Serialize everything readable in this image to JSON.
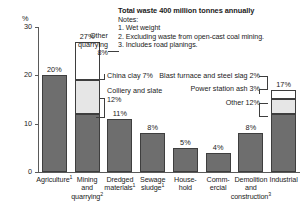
{
  "header": {
    "title": "Total waste 400 million tonnes annually",
    "notes_label": "Notes:",
    "notes": [
      "1. Wet weight",
      "2. Excluding waste from open-cast coal mining.",
      "3. Includes road planings."
    ]
  },
  "axis": {
    "y_unit": "%",
    "y_ticks": [
      "30",
      "20",
      "10",
      "0"
    ]
  },
  "callouts": {
    "other_quarrying": {
      "line1": "Other",
      "line2": "quarrying",
      "line3": "8%"
    },
    "china_clay": "China clay 7%",
    "colliery_1": "Colliery and slate",
    "colliery_2": "12%",
    "blast_furnace": "Blast furnace and steel slag 2%",
    "power_station": "Power station ash 3%",
    "other_industrial": "Other 12%"
  },
  "chart_data": {
    "type": "bar",
    "title": "Total waste 400 million tonnes annually",
    "xlabel": "",
    "ylabel": "%",
    "ylim": [
      0,
      30
    ],
    "yticks": [
      0,
      10,
      20,
      30
    ],
    "grid": false,
    "legend": "none",
    "stacked": true,
    "categories": [
      "Agriculture¹",
      "Mining and quarrying ²",
      "Dredged materials¹",
      "Sewage sludge ¹",
      "House-hold",
      "Comm-ercial",
      "Demolition and construction³",
      "Industrial"
    ],
    "totals": [
      20,
      27,
      11,
      8,
      5,
      4,
      8,
      17
    ],
    "total_labels": [
      "20%",
      "27%",
      "11%",
      "8%",
      "5%",
      "4%",
      "8%",
      "17%"
    ],
    "bars": [
      {
        "category": "Agriculture¹",
        "total": 20,
        "segments": [
          {
            "label": "Agriculture",
            "value": 20,
            "fill": "dark"
          }
        ]
      },
      {
        "category": "Mining and quarrying ²",
        "total": 27,
        "segments": [
          {
            "label": "Colliery and slate",
            "value": 12,
            "fill": "dark"
          },
          {
            "label": "China clay",
            "value": 7,
            "fill": "light"
          },
          {
            "label": "Other quarrying",
            "value": 8,
            "fill": "white"
          }
        ]
      },
      {
        "category": "Dredged materials¹",
        "total": 11,
        "segments": [
          {
            "label": "Dredged materials",
            "value": 11,
            "fill": "dark"
          }
        ]
      },
      {
        "category": "Sewage sludge ¹",
        "total": 8,
        "segments": [
          {
            "label": "Sewage sludge",
            "value": 8,
            "fill": "dark"
          }
        ]
      },
      {
        "category": "House-hold",
        "total": 5,
        "segments": [
          {
            "label": "Household",
            "value": 5,
            "fill": "dark"
          }
        ]
      },
      {
        "category": "Comm-ercial",
        "total": 4,
        "segments": [
          {
            "label": "Commercial",
            "value": 4,
            "fill": "dark"
          }
        ]
      },
      {
        "category": "Demolition and construction³",
        "total": 8,
        "segments": [
          {
            "label": "Demolition and construction",
            "value": 8,
            "fill": "dark"
          }
        ]
      },
      {
        "category": "Industrial",
        "total": 17,
        "segments": [
          {
            "label": "Other",
            "value": 12,
            "fill": "dark"
          },
          {
            "label": "Power station ash",
            "value": 3,
            "fill": "light"
          },
          {
            "label": "Blast furnace and steel slag",
            "value": 2,
            "fill": "white"
          }
        ]
      }
    ],
    "colors": {
      "dark": "#6e6e6e",
      "light": "#e6e6e6",
      "white": "#ffffff",
      "outline": "#3e3e3e",
      "axis": "#5a5a5a"
    }
  },
  "categories_display": [
    {
      "lines": [
        "Agriculture"
      ],
      "sup": "1"
    },
    {
      "lines": [
        "Mining",
        "and",
        "quarrying"
      ],
      "sup": "2"
    },
    {
      "lines": [
        "Dredged",
        "materials"
      ],
      "sup": "1"
    },
    {
      "lines": [
        "Sewage",
        "sludge"
      ],
      "sup": "1"
    },
    {
      "lines": [
        "House-",
        "hold"
      ],
      "sup": ""
    },
    {
      "lines": [
        "Comm-",
        "ercial"
      ],
      "sup": ""
    },
    {
      "lines": [
        "Demolition",
        "and",
        "construction"
      ],
      "sup": "3"
    },
    {
      "lines": [
        "Industrial"
      ],
      "sup": ""
    }
  ]
}
